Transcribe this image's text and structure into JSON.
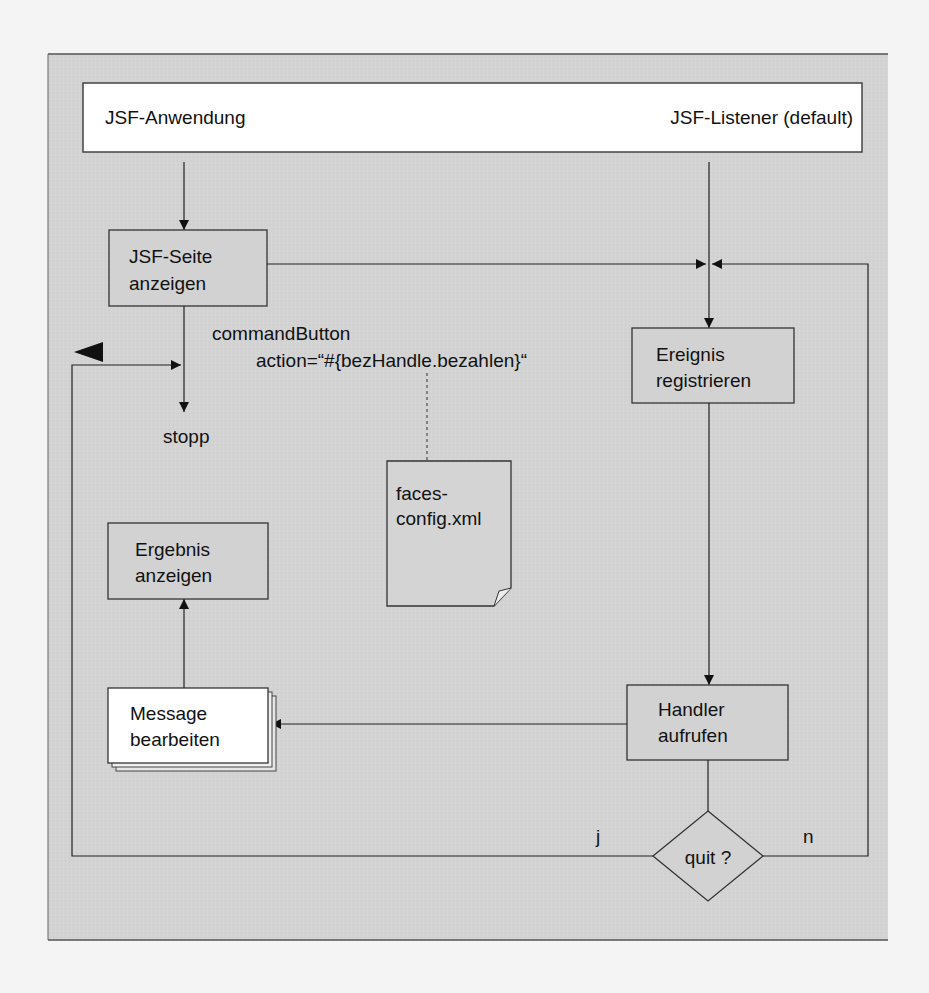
{
  "diagram": {
    "colors": {
      "background": "#f4f4f4",
      "panel": "#d4d4d4",
      "box_fill": "#d2d2d2",
      "white_fill": "#ffffff",
      "stroke": "#333333"
    },
    "header": {
      "left_label": "JSF-Anwendung",
      "right_label": "JSF-Listener (default)"
    },
    "nodes": {
      "jsf_page": {
        "line1": "JSF-Seite",
        "line2": "anzeigen"
      },
      "register_event": {
        "line1": "Ereignis",
        "line2": "registrieren"
      },
      "call_handler": {
        "line1": "Handler",
        "line2": "aufrufen"
      },
      "show_result": {
        "line1": "Ergebnis",
        "line2": "anzeigen"
      },
      "process_message": {
        "line1": "Message",
        "line2": "bearbeiten"
      },
      "decision": {
        "label": "quit ?"
      },
      "config_document": {
        "line1": "faces-",
        "line2": "config.xml"
      },
      "stop": {
        "label": "stopp"
      }
    },
    "annotations": {
      "command_button_line1": "commandButton",
      "command_button_line2": "action=“#{bezHandle.bezahlen}“",
      "yes_label": "j",
      "no_label": "n"
    }
  }
}
